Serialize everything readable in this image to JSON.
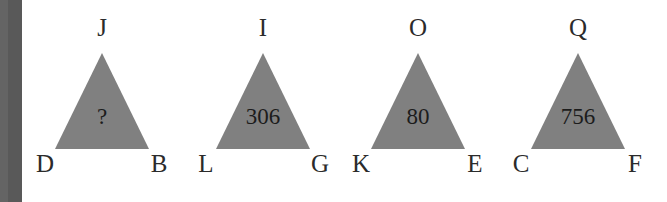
{
  "page": {
    "background_color": "#ffffff",
    "edge_bar_color": "#595959",
    "triangle_fill_color": "#808080",
    "label_color": "#2b2b2b"
  },
  "figures": [
    {
      "name": "triangle-1",
      "apex_label": "J",
      "base_left_label": "D",
      "base_right_label": "B",
      "inner_value": "?"
    },
    {
      "name": "triangle-2",
      "apex_label": "I",
      "base_left_label": "L",
      "base_right_label": "G",
      "inner_value": "306"
    },
    {
      "name": "triangle-3",
      "apex_label": "O",
      "base_left_label": "K",
      "base_right_label": "E",
      "inner_value": "80"
    },
    {
      "name": "triangle-4",
      "apex_label": "Q",
      "base_left_label": "C",
      "base_right_label": "F",
      "inner_value": "756"
    }
  ]
}
